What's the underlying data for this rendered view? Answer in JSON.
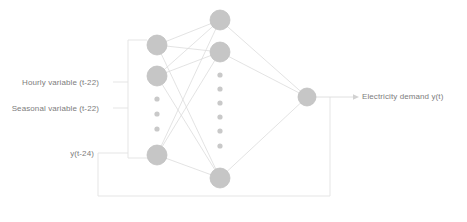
{
  "diagram": {
    "colors": {
      "node_fill": "#c6c6c6",
      "node_stroke": "#bdbdbd",
      "dot_fill": "#c9c9c9",
      "edge": "#dcdcdc",
      "bracket": "#e2e2e2",
      "text": "#7d7d7d",
      "background": "#ffffff"
    },
    "labels": {
      "input_hourly": "Hourly variable (t-22)",
      "input_seasonal": "Seasonal variable (t-22)",
      "feedback": "y(t-24)",
      "output": "Electricity demand y(t)"
    },
    "layers": {
      "input": {
        "name": "input-layer",
        "node_count_visible": 3,
        "ellipsis_dots": 3,
        "nodes": [
          {
            "cx": 157,
            "cy": 45,
            "r": 10
          },
          {
            "cx": 157,
            "cy": 76,
            "r": 10
          },
          {
            "cx": 157,
            "cy": 155,
            "r": 10
          }
        ],
        "dots": [
          {
            "cx": 157,
            "cy": 99,
            "r": 2.6
          },
          {
            "cx": 157,
            "cy": 114,
            "r": 2.6
          },
          {
            "cx": 157,
            "cy": 129,
            "r": 2.6
          }
        ]
      },
      "hidden": {
        "name": "hidden-layer",
        "node_count_visible": 3,
        "ellipsis_dots": 6,
        "nodes": [
          {
            "cx": 220,
            "cy": 20,
            "r": 10
          },
          {
            "cx": 220,
            "cy": 52,
            "r": 10
          },
          {
            "cx": 220,
            "cy": 178,
            "r": 10
          }
        ],
        "dots": [
          {
            "cx": 220,
            "cy": 75,
            "r": 2.6
          },
          {
            "cx": 220,
            "cy": 89,
            "r": 2.6
          },
          {
            "cx": 220,
            "cy": 103,
            "r": 2.6
          },
          {
            "cx": 220,
            "cy": 117,
            "r": 2.6
          },
          {
            "cx": 220,
            "cy": 131,
            "r": 2.6
          },
          {
            "cx": 220,
            "cy": 146,
            "r": 2.6
          }
        ]
      },
      "output": {
        "name": "output-layer",
        "node_count_visible": 1,
        "nodes": [
          {
            "cx": 307,
            "cy": 97,
            "r": 9
          }
        ]
      }
    },
    "edges": {
      "input_to_hidden": [
        {
          "from": [
            157,
            45
          ],
          "to": [
            220,
            20
          ]
        },
        {
          "from": [
            157,
            45
          ],
          "to": [
            220,
            52
          ]
        },
        {
          "from": [
            157,
            45
          ],
          "to": [
            220,
            178
          ]
        },
        {
          "from": [
            157,
            76
          ],
          "to": [
            220,
            20
          ]
        },
        {
          "from": [
            157,
            76
          ],
          "to": [
            220,
            52
          ]
        },
        {
          "from": [
            157,
            76
          ],
          "to": [
            220,
            178
          ]
        },
        {
          "from": [
            157,
            155
          ],
          "to": [
            220,
            20
          ]
        },
        {
          "from": [
            157,
            155
          ],
          "to": [
            220,
            52
          ]
        },
        {
          "from": [
            157,
            155
          ],
          "to": [
            220,
            178
          ]
        }
      ],
      "hidden_to_output": [
        {
          "from": [
            220,
            20
          ],
          "to": [
            307,
            97
          ]
        },
        {
          "from": [
            220,
            52
          ],
          "to": [
            307,
            97
          ]
        },
        {
          "from": [
            220,
            178
          ],
          "to": [
            307,
            97
          ]
        }
      ]
    },
    "connectors": {
      "input_bracket": {
        "name": "input-bracket",
        "vertical_x": 128,
        "top_y": 40,
        "bottom_y": 158,
        "stub_to_node_top": [
          128,
          40,
          147,
          40
        ],
        "stub_to_node_bottom": [
          128,
          158,
          147,
          158
        ],
        "label_stubs": [
          {
            "y": 82,
            "x1": 113,
            "x2": 128
          },
          {
            "y": 108,
            "x1": 113,
            "x2": 128
          }
        ]
      },
      "output_arrow": {
        "name": "output-arrow",
        "x1": 316,
        "y": 97,
        "x2": 357,
        "arrowhead": true
      },
      "feedback_loop": {
        "name": "feedback-loop",
        "path": [
          [
            330,
            97
          ],
          [
            330,
            196
          ],
          [
            98,
            196
          ],
          [
            98,
            153
          ],
          [
            128,
            153
          ]
        ],
        "note": "output fed back to input layer"
      }
    }
  }
}
